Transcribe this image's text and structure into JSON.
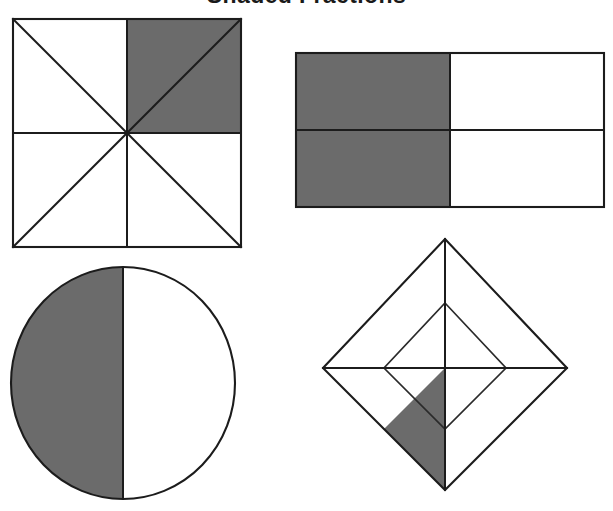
{
  "worksheet": {
    "title": "Shaded Fractions",
    "background_color": "#ffffff",
    "ink_color": "#1c1c1c",
    "shade_color": "#6b6b6b"
  },
  "figures": [
    {
      "id": "figure-1",
      "name": "square-eighths",
      "shape": "square",
      "position": "top-left",
      "total_parts": 8,
      "shaded_parts": 2,
      "fraction": "2/8",
      "simplified_fraction": "1/4",
      "part_shape": "triangle",
      "description": "Square divided by both diagonals and both midlines into 8 triangles; the 2 triangles forming the top-right quadrant are shaded."
    },
    {
      "id": "figure-2",
      "name": "rectangle-fourths",
      "shape": "rectangle",
      "position": "top-right",
      "total_parts": 4,
      "shaded_parts": 2,
      "fraction": "2/4",
      "simplified_fraction": "1/2",
      "part_shape": "rectangle",
      "description": "Rectangle divided into a 2 by 2 grid of 4 equal rectangles; the 2 left-hand rectangles are shaded."
    },
    {
      "id": "figure-3",
      "name": "circle-halves",
      "shape": "circle",
      "position": "bottom-left",
      "total_parts": 2,
      "shaded_parts": 1,
      "fraction": "1/2",
      "simplified_fraction": "1/2",
      "part_shape": "semicircle",
      "description": "Circle divided by a vertical diameter into 2 equal halves; the left half is shaded."
    },
    {
      "id": "figure-4",
      "name": "diamond-eighths",
      "shape": "diamond",
      "position": "bottom-right",
      "total_parts": 8,
      "shaded_parts": 1,
      "fraction": "1/8",
      "simplified_fraction": "1/8",
      "part_shape": "triangle",
      "description": "Diamond with an inscribed square joining the midpoints of its sides plus both diagonals, forming 8 triangles; one triangle at the lower left of the bottom quadrant is shaded."
    }
  ]
}
